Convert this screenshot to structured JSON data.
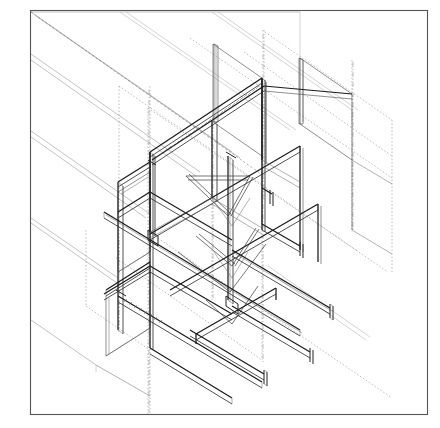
{
  "document": {
    "title": "Isometric Structural Steel Frame Assembly",
    "type": "technical-line-drawing",
    "drawing_style": "axonometric / isometric projection",
    "background_color": "#ffffff",
    "line_color": "#1b1b1b",
    "border_color": "#555555",
    "canvas": {
      "width": 440,
      "height": 428
    }
  },
  "border": {
    "name": "drawing-sheet-border",
    "x": 30,
    "y": 10,
    "width": 398,
    "height": 405
  },
  "legend": {
    "line_types": [
      {
        "name": "visible-outline",
        "style": "solid-heavy",
        "color": "#1b1b1b"
      },
      {
        "name": "visible-detail",
        "style": "solid-thin",
        "color": "#444444"
      },
      {
        "name": "hidden-edge",
        "style": "dashed",
        "color": "#777777"
      },
      {
        "name": "center-line",
        "style": "dash-dot",
        "color": "#888888"
      },
      {
        "name": "background-plane",
        "style": "solid-light",
        "color": "#9a9a9a"
      }
    ]
  },
  "geometry": {
    "iso_axis_right_deg": 30,
    "iso_axis_left_deg": 150,
    "vertical_axis_deg": 90,
    "description": "Steel moment frame: columns, primary beams, secondary beams, diagonal knee bracing and bolted end-plate connections drawn in isometric projection over a sloping background slab plane."
  },
  "components": [
    {
      "name": "background-slab-planes",
      "count": 6,
      "note": "parallel sloping lines upper-left field"
    },
    {
      "name": "vertical-column",
      "count": 8
    },
    {
      "name": "primary-beam",
      "count": 9
    },
    {
      "name": "secondary-beam",
      "count": 6
    },
    {
      "name": "diagonal-brace",
      "count": 7
    },
    {
      "name": "end-plate-connection",
      "count": 8
    },
    {
      "name": "hidden-grid-line",
      "count": 14
    },
    {
      "name": "column-center-line",
      "count": 5
    },
    {
      "name": "rear-panel-frame",
      "count": 3
    }
  ]
}
